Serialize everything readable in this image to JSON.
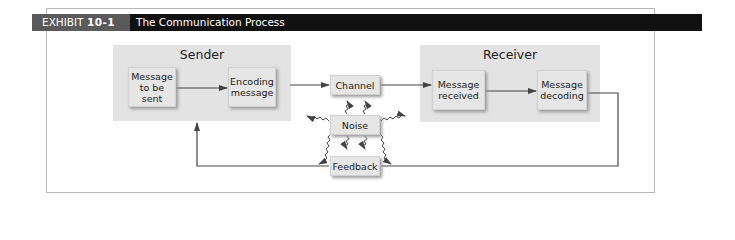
{
  "header": {
    "exhibit_prefix": "EXHIBIT ",
    "exhibit_number": "10-1",
    "title": "The Communication Process"
  },
  "diagram": {
    "sender": {
      "label": "Sender",
      "steps": [
        "Message to be sent",
        "Encoding message"
      ]
    },
    "receiver": {
      "label": "Receiver",
      "steps": [
        "Message received",
        "Message decoding"
      ]
    },
    "channel": "Channel",
    "noise": "Noise",
    "feedback": "Feedback",
    "flow": [
      "Message to be sent -> Encoding message",
      "Encoding message -> Channel",
      "Channel -> Message received",
      "Message received -> Message decoding",
      "Message decoding -> Feedback -> Sender",
      "Noise ~> Channel, Sender, Receiver, Feedback"
    ],
    "colors": {
      "group_bg": "#e3e3e3",
      "box_bg": "#e6e6e6",
      "header_bg": "#111111",
      "exhibit_bg": "#5a5a5a",
      "line": "#444444"
    }
  }
}
